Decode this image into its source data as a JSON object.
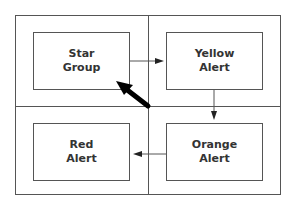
{
  "diagram": {
    "nodes": [
      {
        "id": "star",
        "line1": "Star",
        "line2": "Group"
      },
      {
        "id": "yellow",
        "line1": "Yellow",
        "line2": "Alert"
      },
      {
        "id": "orange",
        "line1": "Orange",
        "line2": "Alert"
      },
      {
        "id": "red",
        "line1": "Red",
        "line2": "Alert"
      }
    ],
    "edges": [
      {
        "from": "Star Group",
        "to": "Yellow Alert"
      },
      {
        "from": "Yellow Alert",
        "to": "Orange Alert"
      },
      {
        "from": "Orange Alert",
        "to": "Red Alert"
      }
    ],
    "pointer": {
      "icon": "bold-arrow-icon",
      "points_to": "Star Group"
    },
    "colors": {
      "stroke": "#555555",
      "text": "#333333",
      "pointer": "#000000"
    }
  }
}
